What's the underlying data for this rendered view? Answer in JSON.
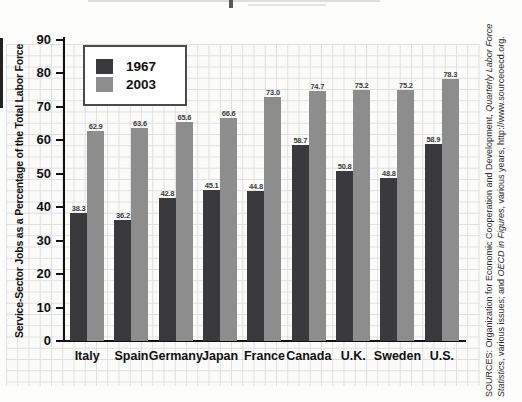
{
  "chart_data": {
    "type": "bar",
    "title": "",
    "categories": [
      "Italy",
      "Spain",
      "Germany",
      "Japan",
      "France",
      "Canada",
      "U.K.",
      "Sweden",
      "U.S."
    ],
    "series": [
      {
        "name": "1967",
        "color": "#3a3a3c",
        "values": [
          38.3,
          36.2,
          42.8,
          45.1,
          44.8,
          58.7,
          50.8,
          48.8,
          58.9
        ]
      },
      {
        "name": "2003",
        "color": "#8d8d8d",
        "values": [
          62.9,
          63.6,
          65.6,
          66.6,
          73.0,
          74.7,
          75.2,
          75.2,
          78.3
        ]
      }
    ],
    "xlabel": "",
    "ylabel": "Service-Sector Jobs as a Percentage of the Total Labor Force",
    "ylim": [
      0,
      90
    ],
    "yticks": [
      0,
      10,
      20,
      30,
      40,
      50,
      60,
      70,
      80,
      90
    ],
    "grid": true,
    "grid_style": "graph-paper",
    "grid_color": "#dfdfdf",
    "axis_color": "#111111",
    "value_labels_shown": true,
    "legend_position": "upper-left"
  },
  "legend": {
    "items": [
      {
        "label": "1967",
        "color": "#3a3a3c"
      },
      {
        "label": "2003",
        "color": "#8d8d8d"
      }
    ]
  },
  "source": {
    "line1": [
      {
        "text": "SOURCES: Organization for Economic Cooperation and Development, ",
        "italic": false
      },
      {
        "text": "Quarterly Labor Force",
        "italic": true
      }
    ],
    "line2": [
      {
        "text": "Statistics",
        "italic": true
      },
      {
        "text": ", various issues; and ",
        "italic": false
      },
      {
        "text": "OECD in Figures",
        "italic": true
      },
      {
        "text": ", various years, http://www.sourceoecd.org.",
        "italic": false
      }
    ]
  }
}
